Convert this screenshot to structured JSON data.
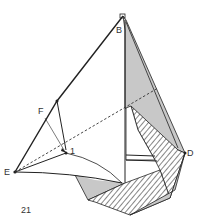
{
  "figure": {
    "step_number": "21",
    "labels": {
      "B": "B",
      "D": "D",
      "E": "E",
      "F": "F",
      "point1": "1"
    },
    "colors": {
      "line": "#222222",
      "shade": "#c8c8c8",
      "hatch": "#444444",
      "background": "#ffffff"
    }
  }
}
